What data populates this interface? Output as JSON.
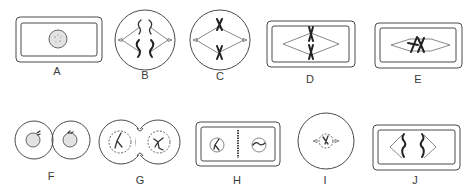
{
  "figure": {
    "type": "mitosis-stages-diagram",
    "panels": [
      {
        "id": "A",
        "label": "A",
        "shape": "rectangular-cell",
        "contents": "interphase nucleus"
      },
      {
        "id": "B",
        "label": "B",
        "shape": "round-cell",
        "contents": "chromosomes condensing, spindle forming"
      },
      {
        "id": "C",
        "label": "C",
        "shape": "round-cell",
        "contents": "two X chromosomes on spindle"
      },
      {
        "id": "D",
        "label": "D",
        "shape": "rectangular-cell",
        "contents": "chromosomes aligned at equator of spindle"
      },
      {
        "id": "E",
        "label": "E",
        "shape": "rectangular-cell",
        "contents": "chromosomes on spindle, tilted"
      },
      {
        "id": "F",
        "label": "F",
        "shape": "two-round-cells",
        "contents": "two daughter cells with nuclei"
      },
      {
        "id": "G",
        "label": "G",
        "shape": "two-fused-round-cells",
        "contents": "nuclei with dashed envelopes re-forming"
      },
      {
        "id": "H",
        "label": "H",
        "shape": "rectangular-cell",
        "contents": "cell plate forming between two nuclei"
      },
      {
        "id": "I",
        "label": "I",
        "shape": "round-cell",
        "contents": "small nucleus with spindle poles"
      },
      {
        "id": "J",
        "label": "J",
        "shape": "rectangular-cell",
        "contents": "chromatids separating to poles"
      }
    ]
  }
}
